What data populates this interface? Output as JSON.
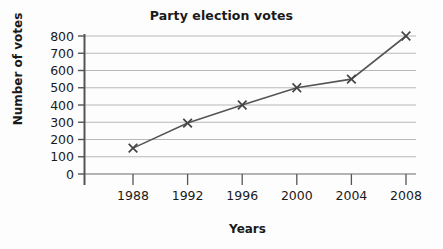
{
  "chart_data": {
    "type": "line",
    "title": "Party election votes",
    "xlabel": "Years",
    "ylabel": "Number of votes",
    "categories": [
      "1988",
      "1992",
      "1996",
      "2000",
      "2004",
      "2008"
    ],
    "values": [
      150,
      295,
      400,
      500,
      550,
      800
    ],
    "series": [
      {
        "name": "Party election votes",
        "values": [
          150,
          295,
          400,
          500,
          550,
          800
        ]
      }
    ],
    "ylim": [
      0,
      800
    ],
    "ytick_labels": [
      "0",
      "100",
      "200",
      "300",
      "400",
      "500",
      "600",
      "700",
      "800"
    ],
    "ytick_values": [
      0,
      100,
      200,
      300,
      400,
      500,
      600,
      700,
      800
    ],
    "grid": true,
    "grid_axis": "y",
    "legend": "none",
    "marker": "x",
    "colors": {
      "line": "#555555",
      "marker": "#444444",
      "gridline": "#b8b8b8",
      "axis": "#555555",
      "text": "#1a1a1a",
      "background": "#fdfdfd"
    }
  }
}
